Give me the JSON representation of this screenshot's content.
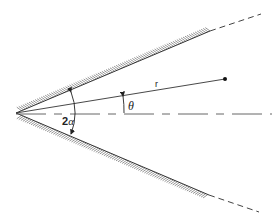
{
  "diagram": {
    "type": "wedge-geometry",
    "colors": {
      "line": "#333333",
      "hatch": "#555555",
      "dash": "#444444",
      "background": "#ffffff"
    },
    "apex": {
      "x": 16,
      "y": 113
    },
    "wedge": {
      "upper_wall": {
        "end_solid": {
          "x": 210,
          "y": 31
        },
        "end_dashed": {
          "x": 261,
          "y": 14
        }
      },
      "lower_wall": {
        "end_solid": {
          "x": 209,
          "y": 195
        },
        "end_dashed": {
          "x": 259,
          "y": 212
        }
      }
    },
    "axis": {
      "y": 114,
      "x_start": 16,
      "x_end": 272
    },
    "radius_vector": {
      "end": {
        "x": 225,
        "y": 79
      },
      "label": "r"
    },
    "angles": {
      "half_wedge_total": {
        "label": "2α",
        "label_num": "2",
        "label_sym": "α"
      },
      "theta": {
        "label": "θ"
      }
    }
  }
}
